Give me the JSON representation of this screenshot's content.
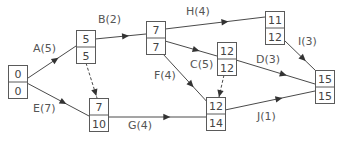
{
  "diagram": {
    "type": "activity-network",
    "nodes": [
      {
        "id": "n0",
        "early": "0",
        "late": "0",
        "x": 8,
        "y": 65
      },
      {
        "id": "n5",
        "early": "5",
        "late": "5",
        "x": 76,
        "y": 30
      },
      {
        "id": "n7a",
        "early": "7",
        "late": "7",
        "x": 146,
        "y": 21
      },
      {
        "id": "n11",
        "early": "11",
        "late": "12",
        "x": 265,
        "y": 11
      },
      {
        "id": "n12a",
        "early": "12",
        "late": "12",
        "x": 217,
        "y": 42
      },
      {
        "id": "n7b",
        "early": "7",
        "late": "10",
        "x": 89,
        "y": 98
      },
      {
        "id": "n12b",
        "early": "12",
        "late": "14",
        "x": 206,
        "y": 97
      },
      {
        "id": "n15",
        "early": "15",
        "late": "15",
        "x": 315,
        "y": 70
      }
    ],
    "edges": [
      {
        "label": "A(5)",
        "from": [
          25,
          80
        ],
        "to": [
          76,
          46
        ],
        "lx": 33,
        "ly": 52
      },
      {
        "label": "E(7)",
        "from": [
          25,
          82
        ],
        "to": [
          89,
          116
        ],
        "lx": 33,
        "ly": 112
      },
      {
        "label": "B(2)",
        "from": [
          95,
          39
        ],
        "to": [
          146,
          34
        ],
        "lx": 98,
        "ly": 23
      },
      {
        "label": "",
        "from": [
          86,
          63
        ],
        "to": [
          97,
          98
        ],
        "dummy": true,
        "lx": 0,
        "ly": 0
      },
      {
        "label": "H(4)",
        "from": [
          165,
          29
        ],
        "to": [
          265,
          17
        ],
        "lx": 186,
        "ly": 15
      },
      {
        "label": "C(5)",
        "from": [
          165,
          41
        ],
        "to": [
          217,
          56
        ],
        "lx": 190,
        "ly": 68
      },
      {
        "label": "F(4)",
        "from": [
          163,
          54
        ],
        "to": [
          210,
          105
        ],
        "lx": 154,
        "ly": 79
      },
      {
        "label": "G(4)",
        "from": [
          108,
          117
        ],
        "to": [
          206,
          117
        ],
        "lx": 128,
        "ly": 129
      },
      {
        "label": "",
        "from": [
          224,
          75
        ],
        "to": [
          219,
          97
        ],
        "dummy": true,
        "lx": 0,
        "ly": 0
      },
      {
        "label": "I(3)",
        "from": [
          284,
          40
        ],
        "to": [
          316,
          71
        ],
        "lx": 298,
        "ly": 45
      },
      {
        "label": "D(3)",
        "from": [
          236,
          60
        ],
        "to": [
          315,
          84
        ],
        "lx": 256,
        "ly": 63
      },
      {
        "label": "J(1)",
        "from": [
          225,
          110
        ],
        "to": [
          315,
          91
        ],
        "lx": 257,
        "ly": 120
      }
    ],
    "node_size": {
      "w": 19,
      "h": 33
    },
    "colors": {
      "stroke": "#5a5a5a",
      "text": "#444444",
      "arrow": "#333333"
    }
  }
}
